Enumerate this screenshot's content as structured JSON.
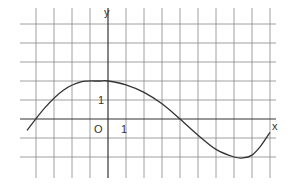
{
  "chart_data": {
    "type": "line",
    "title": "",
    "xlabel": "x",
    "ylabel": "y",
    "origin_label": "O",
    "x_tick_label": "1",
    "y_tick_label": "1",
    "grid": true,
    "xlim": [
      -4,
      9
    ],
    "ylim": [
      -3,
      5
    ],
    "series": [
      {
        "name": "curve",
        "x": [
          -4.5,
          -3.5,
          -2.5,
          -1.5,
          -0.5,
          0,
          1,
          2,
          3,
          4,
          5,
          6,
          7,
          7.5,
          8,
          8.5,
          9
        ],
        "values": [
          -0.6,
          0.6,
          1.5,
          1.95,
          2.0,
          2.0,
          1.8,
          1.4,
          0.8,
          0.0,
          -0.85,
          -1.6,
          -2.0,
          -2.05,
          -1.9,
          -1.4,
          -0.7
        ]
      }
    ]
  },
  "colors": {
    "grid": "#888888",
    "axis": "#333333",
    "curve": "#333333",
    "background": "#ffffff"
  }
}
